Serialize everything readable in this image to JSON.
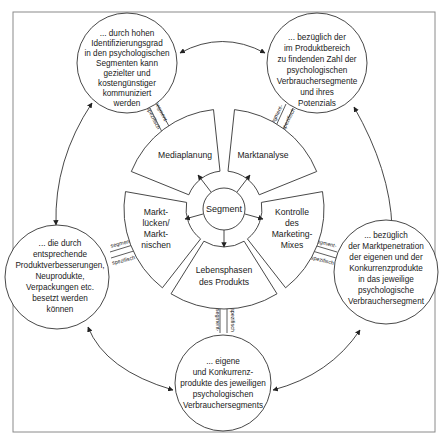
{
  "diagram": {
    "center": {
      "label": "Segment"
    },
    "segments": [
      {
        "id": "mediaplanung",
        "lines": [
          "Mediaplanung"
        ]
      },
      {
        "id": "marktanalyse",
        "lines": [
          "Marktanalyse"
        ]
      },
      {
        "id": "kontrolle",
        "lines": [
          "Kontrolle",
          "des",
          "Marketing-",
          "Mixes"
        ]
      },
      {
        "id": "lebensphasen",
        "lines": [
          "Lebensphasen",
          "des Produkts"
        ]
      },
      {
        "id": "marktluecken",
        "lines": [
          "Markt-",
          "lücken/",
          "Markt-",
          "nischen"
        ]
      }
    ],
    "outer_nodes": [
      {
        "id": "top-left",
        "lines": [
          "... durch hohen",
          "Identifizierungsgrad",
          "in den psychologischen",
          "Segmenten kann",
          "gezielter und",
          "kostengünstiger",
          "kommuniziert",
          "werden"
        ]
      },
      {
        "id": "top-right",
        "lines": [
          "... bezüglich der",
          "im Produktbereich",
          "zu findenden Zahl der",
          "psychologischen",
          "Verbrauchersegmente",
          "und ihres",
          "Potenzials"
        ]
      },
      {
        "id": "right",
        "lines": [
          "... bezüglich",
          "der Marktpenetration",
          "der eigenen und der",
          "Konkurrenzprodukte",
          "in das jeweilige",
          "psychologische",
          "Verbrauchersegment"
        ]
      },
      {
        "id": "bottom",
        "lines": [
          "... eigene",
          "und Konkurrenz-",
          "produkte des jeweiligen",
          "psychologischen",
          "Verbrauchersegments"
        ]
      },
      {
        "id": "left",
        "lines": [
          "... die durch",
          "entsprechende",
          "Produktverbesserungen,",
          "Neuprodukte,",
          "Verpackungen etc.",
          "besetzt werden",
          "können"
        ]
      }
    ],
    "connector_labels": {
      "first": "segment-",
      "second": "spezifisch"
    }
  }
}
